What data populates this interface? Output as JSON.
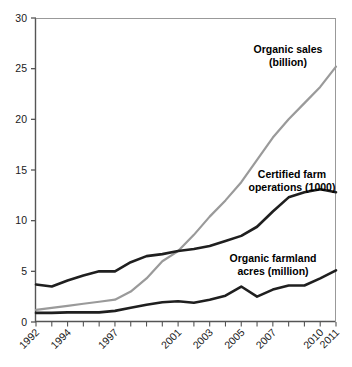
{
  "chart_data": {
    "type": "line",
    "title": "",
    "subtitle": "",
    "xlabel": "",
    "ylabel": "",
    "xlim": [
      1992,
      2011
    ],
    "ylim": [
      0,
      30
    ],
    "grid": false,
    "legend_position": "inline-annotations",
    "y_ticks": [
      "0",
      "5",
      "10",
      "15",
      "20",
      "25",
      "30"
    ],
    "y_tick_values": [
      0,
      5,
      10,
      15,
      20,
      25,
      30
    ],
    "x_tick_labels": [
      "1992",
      "1994",
      "1997",
      "2001",
      "2003",
      "2005",
      "2007",
      "2010",
      "2011"
    ],
    "x_tick_values": [
      1992,
      1994,
      1997,
      2001,
      2003,
      2005,
      2007,
      2010,
      2011
    ],
    "x": [
      1992,
      1993,
      1994,
      1995,
      1996,
      1997,
      1998,
      1999,
      2000,
      2001,
      2002,
      2003,
      2004,
      2005,
      2006,
      2007,
      2008,
      2009,
      2010,
      2011
    ],
    "series": [
      {
        "name": "Organic sales (billion)",
        "color": "#9a9a9a",
        "width": 2.2,
        "values": [
          1.2,
          1.4,
          1.6,
          1.8,
          2.0,
          2.2,
          3.0,
          4.3,
          6.0,
          7.0,
          8.6,
          10.4,
          12.0,
          13.8,
          16.0,
          18.2,
          20.0,
          21.6,
          23.2,
          25.2
        ]
      },
      {
        "name": "Certified farm operations (1000)",
        "color": "#1f1f1f",
        "width": 2.6,
        "values": [
          3.7,
          3.5,
          4.1,
          4.6,
          5.0,
          5.0,
          5.9,
          6.5,
          6.7,
          7.0,
          7.2,
          7.5,
          8.0,
          8.5,
          9.4,
          10.9,
          12.3,
          12.8,
          13.1,
          12.8
        ]
      },
      {
        "name": "Organic farmland acres (million)",
        "color": "#1f1f1f",
        "width": 2.6,
        "values": [
          0.9,
          0.9,
          0.95,
          0.95,
          0.95,
          1.1,
          1.4,
          1.7,
          1.95,
          2.05,
          1.9,
          2.2,
          2.6,
          3.5,
          2.5,
          3.2,
          3.6,
          3.6,
          4.3,
          5.1
        ]
      }
    ],
    "annotations": [
      {
        "id": "organic-sales",
        "lines": [
          "Organic sales",
          "(billion)"
        ],
        "x_px": 288,
        "y_px": 53
      },
      {
        "id": "certified-farm-operations",
        "lines": [
          "Certified farm",
          "operations (1000)"
        ],
        "x_px": 292,
        "y_px": 178
      },
      {
        "id": "organic-farmland-acres",
        "lines": [
          "Organic farmland",
          "acres (million)"
        ],
        "x_px": 273,
        "y_px": 262
      }
    ]
  }
}
